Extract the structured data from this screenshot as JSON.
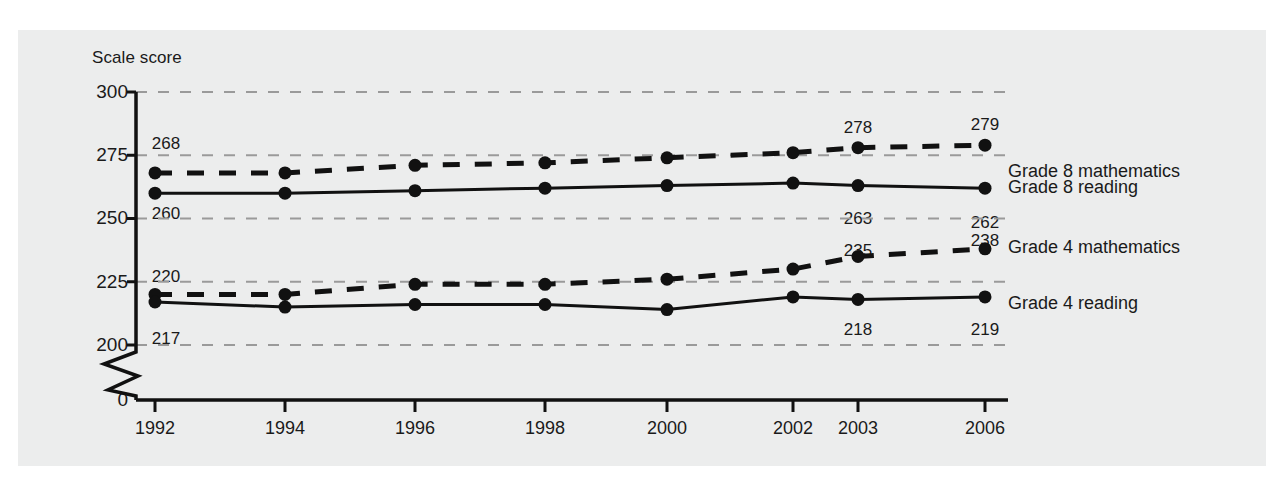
{
  "chart_data": {
    "type": "line",
    "title": "",
    "ylabel": "Scale score",
    "xlabel": "",
    "categories": [
      "1992",
      "1994",
      "1996",
      "1998",
      "2000",
      "2002",
      "2003",
      "2006"
    ],
    "x_positions": [
      155,
      285,
      415,
      545,
      667,
      793,
      858,
      985
    ],
    "ylim": [
      200,
      300
    ],
    "y_ticks": [
      "300",
      "275",
      "250",
      "225",
      "200",
      "0"
    ],
    "y_tick_values": [
      300,
      275,
      250,
      225,
      200,
      0
    ],
    "grid": true,
    "axis_break": true,
    "legend_position": "right-inline",
    "series": [
      {
        "name": "Grade 8 mathematics",
        "style": "dashed",
        "x": [
          "1992",
          "1994",
          "1996",
          "1998",
          "2000",
          "2002",
          "2003",
          "2006"
        ],
        "values": [
          268,
          268,
          271,
          272,
          274,
          276,
          278,
          279
        ],
        "labeled_points": [
          {
            "x": "1992",
            "value": 268,
            "text": "268",
            "placement": "above"
          },
          {
            "x": "2003",
            "value": 278,
            "text": "278",
            "placement": "above"
          },
          {
            "x": "2006",
            "value": 279,
            "text": "279",
            "placement": "above"
          }
        ]
      },
      {
        "name": "Grade 8 reading",
        "style": "solid",
        "x": [
          "1992",
          "1994",
          "1996",
          "1998",
          "2000",
          "2002",
          "2003",
          "2006"
        ],
        "values": [
          260,
          260,
          261,
          262,
          263,
          264,
          263,
          262
        ],
        "labeled_points": [
          {
            "x": "1992",
            "value": 260,
            "text": "260",
            "placement": "below"
          },
          {
            "x": "2003",
            "value": 263,
            "text": "263",
            "placement": "below"
          },
          {
            "x": "2006",
            "value": 262,
            "text": "262",
            "placement": "below"
          }
        ]
      },
      {
        "name": "Grade 4 mathematics",
        "style": "dashed",
        "x": [
          "1992",
          "1994",
          "1996",
          "1998",
          "2000",
          "2002",
          "2003",
          "2006"
        ],
        "values": [
          220,
          220,
          224,
          224,
          226,
          230,
          235,
          238
        ],
        "labeled_points": [
          {
            "x": "1992",
            "value": 220,
            "text": "220",
            "placement": "above"
          },
          {
            "x": "2003",
            "value": 235,
            "text": "235",
            "placement": "above"
          },
          {
            "x": "2006",
            "value": 238,
            "text": "238",
            "placement": "above"
          }
        ]
      },
      {
        "name": "Grade 4 reading",
        "style": "solid",
        "x": [
          "1992",
          "1994",
          "1996",
          "1998",
          "2000",
          "2002",
          "2003",
          "2006"
        ],
        "values": [
          217,
          215,
          216,
          216,
          214,
          219,
          218,
          219
        ],
        "labeled_points": [
          {
            "x": "1992",
            "value": 217,
            "text": "217",
            "placement": "below"
          },
          {
            "x": "2003",
            "value": 218,
            "text": "218",
            "placement": "below"
          },
          {
            "x": "2006",
            "value": 219,
            "text": "219",
            "placement": "below"
          }
        ]
      }
    ],
    "colors": {
      "line": "#111111",
      "grid": "#9a9a9a",
      "axis": "#111111",
      "text": "#1a1a1a",
      "panel_background": "#eceded",
      "page_background": "#ffffff"
    }
  },
  "labels": {
    "y_axis_title": "Scale score",
    "y_ticks": [
      "300",
      "275",
      "250",
      "225",
      "200",
      "0"
    ],
    "x_ticks": [
      "1992",
      "1994",
      "1996",
      "1998",
      "2000",
      "2002",
      "2003",
      "2006"
    ],
    "series_names": [
      "Grade 8 mathematics",
      "Grade 8 reading",
      "Grade 4 mathematics",
      "Grade 4 reading"
    ],
    "point_labels": {
      "g8m_1992": "268",
      "g8m_2003": "278",
      "g8m_2006": "279",
      "g8r_1992": "260",
      "g8r_2003": "263",
      "g8r_2006": "262",
      "g4m_1992": "220",
      "g4m_2003": "235",
      "g4m_2006": "238",
      "g4r_1992": "217",
      "g4r_2003": "218",
      "g4r_2006": "219"
    }
  }
}
